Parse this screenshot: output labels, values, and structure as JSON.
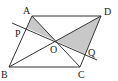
{
  "diagram": {
    "type": "geometry",
    "points": {
      "A": {
        "label": "A",
        "x": 32,
        "y": 16
      },
      "B": {
        "label": "B",
        "x": 9,
        "y": 67
      },
      "C": {
        "label": "C",
        "x": 80,
        "y": 67
      },
      "D": {
        "label": "D",
        "x": 101,
        "y": 16
      },
      "O": {
        "label": "O",
        "x": 56,
        "y": 41
      },
      "P": {
        "label": "P",
        "x": 27,
        "y": 28
      },
      "Q": {
        "label": "Q",
        "x": 85,
        "y": 54
      }
    },
    "shaded_regions": [
      "APO",
      "DOQ"
    ],
    "colors": {
      "line": "#333333",
      "shade": "#c8c8c8",
      "background": "#ffffff"
    }
  }
}
